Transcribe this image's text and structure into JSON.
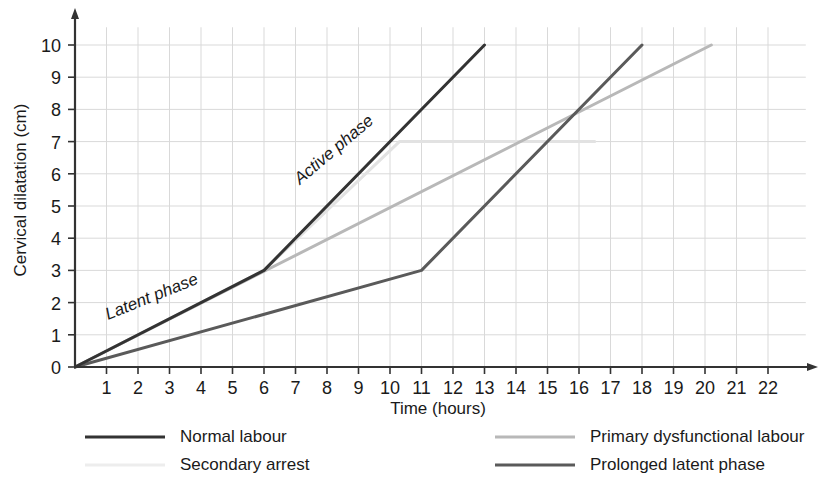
{
  "chart_data": {
    "type": "line",
    "title": "",
    "xlabel": "Time (hours)",
    "ylabel": "Cervical dilatation (cm)",
    "xlim": [
      0,
      23
    ],
    "ylim": [
      0,
      10.8
    ],
    "xticks": [
      "1",
      "2",
      "3",
      "4",
      "5",
      "6",
      "7",
      "8",
      "9",
      "10",
      "11",
      "12",
      "13",
      "14",
      "15",
      "16",
      "17",
      "18",
      "19",
      "20",
      "21",
      "22"
    ],
    "yticks": [
      "0",
      "1",
      "2",
      "3",
      "4",
      "5",
      "6",
      "7",
      "8",
      "9",
      "10"
    ],
    "grid": true,
    "legend_position": "bottom",
    "annotations": [
      {
        "text": "Latent phase",
        "x": 3.0,
        "y": 1.55,
        "rotation": -22
      },
      {
        "text": "Active phase",
        "x": 9.0,
        "y": 6.6,
        "rotation": -40
      }
    ],
    "series": [
      {
        "name": "Normal labour",
        "color": "#333333",
        "width": 3.0,
        "points": [
          [
            0,
            0
          ],
          [
            6,
            3
          ],
          [
            13,
            10
          ]
        ]
      },
      {
        "name": "Secondary arrest",
        "color": "#e2e2e2",
        "width": 3.0,
        "points": [
          [
            0,
            0
          ],
          [
            6,
            3
          ],
          [
            10.3,
            7
          ],
          [
            16.5,
            7
          ]
        ]
      },
      {
        "name": "Primary dysfunctional labour",
        "color": "#b8b8b8",
        "width": 3.0,
        "points": [
          [
            0,
            0
          ],
          [
            20.2,
            10
          ]
        ]
      },
      {
        "name": "Prolonged latent phase",
        "color": "#5a5a5a",
        "width": 3.0,
        "points": [
          [
            0,
            0
          ],
          [
            11,
            3
          ],
          [
            18,
            10
          ]
        ]
      }
    ]
  },
  "axes": {
    "x_title": "Time (hours)",
    "y_title": "Cervical dilatation (cm)"
  },
  "annotations": {
    "latent": "Latent phase",
    "active": "Active phase"
  },
  "legend": {
    "items": [
      {
        "label": "Normal labour",
        "color": "#333333"
      },
      {
        "label": "Primary dysfunctional labour",
        "color": "#b8b8b8"
      },
      {
        "label": "Secondary arrest",
        "color": "#ededed"
      },
      {
        "label": "Prolonged latent phase",
        "color": "#5a5a5a"
      }
    ]
  },
  "ticks": {
    "x": [
      "1",
      "2",
      "3",
      "4",
      "5",
      "6",
      "7",
      "8",
      "9",
      "10",
      "11",
      "12",
      "13",
      "14",
      "15",
      "16",
      "17",
      "18",
      "19",
      "20",
      "21",
      "22"
    ],
    "y": [
      "0",
      "1",
      "2",
      "3",
      "4",
      "5",
      "6",
      "7",
      "8",
      "9",
      "10"
    ]
  },
  "colors": {
    "axis": "#333333",
    "grid": "#d9d9d9",
    "text": "#1a1a1a"
  }
}
